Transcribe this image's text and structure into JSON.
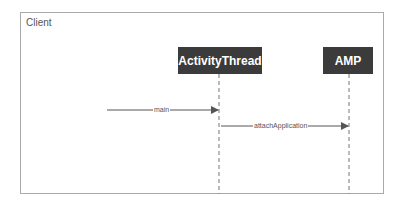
{
  "frame": {
    "label": "Client"
  },
  "participants": [
    {
      "name": "ActivityThread"
    },
    {
      "name": "AMP"
    }
  ],
  "messages": [
    {
      "label": "main",
      "from": "external",
      "to": "ActivityThread"
    },
    {
      "label": "attachApplication",
      "from": "ActivityThread",
      "to": "AMP"
    }
  ],
  "colors": {
    "participant_fill": "#3b3b3b",
    "line": "#555555",
    "frame_border": "#aaaaaa"
  }
}
